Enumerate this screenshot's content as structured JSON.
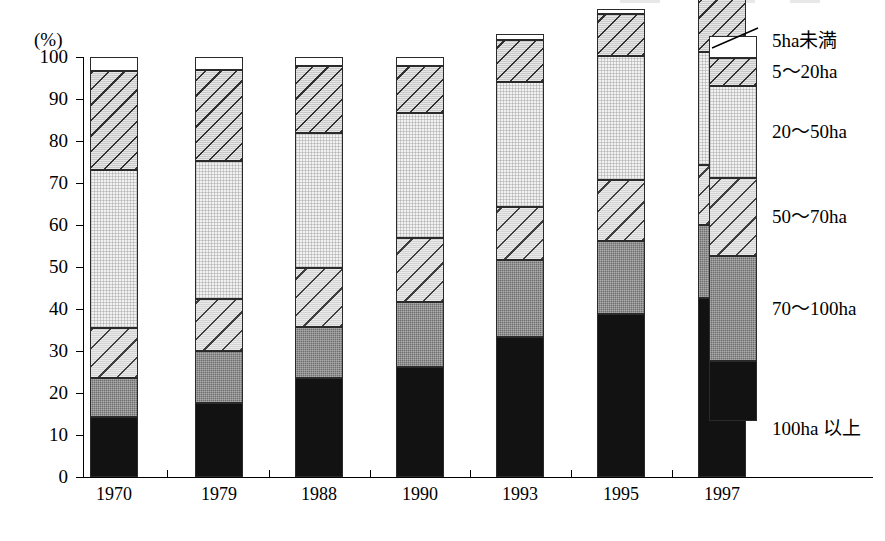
{
  "chart_data": {
    "type": "bar",
    "subtype": "stacked-percentage",
    "title": "",
    "xlabel": "",
    "ylabel": "(%)",
    "ylim": [
      0,
      100
    ],
    "ytick_labels": [
      "0",
      "10",
      "20",
      "30",
      "40",
      "50",
      "60",
      "70",
      "80",
      "90",
      "100"
    ],
    "ytick_values": [
      0,
      10,
      20,
      30,
      40,
      50,
      60,
      70,
      80,
      90,
      100
    ],
    "grid": false,
    "legend_position": "right",
    "categories": [
      "1970",
      "1979",
      "1988",
      "1990",
      "1993",
      "1995",
      "1997"
    ],
    "series": [
      {
        "name": "100ha 以上",
        "pattern": "solid-black",
        "color": "#121212",
        "values": [
          14.3,
          17.6,
          23.6,
          26.2,
          33.3,
          38.8,
          42.6
        ]
      },
      {
        "name": "70～100ha",
        "pattern": "mid-gray",
        "color": "#6e6e6e",
        "values": [
          9.3,
          12.4,
          12.1,
          15.5,
          18.3,
          17.4,
          17.4
        ]
      },
      {
        "name": "50～70ha",
        "pattern": "diagonal-hatch",
        "color": "#d4d4d4",
        "values": [
          11.9,
          12.4,
          14.0,
          15.2,
          12.6,
          14.5,
          14.3
        ]
      },
      {
        "name": "20～50ha",
        "pattern": "light-dots",
        "color": "#f2f2f2",
        "values": [
          37.6,
          32.9,
          32.1,
          29.8,
          29.8,
          29.5,
          26.9
        ]
      },
      {
        "name": "5～20ha",
        "pattern": "diagonal-hatch",
        "color": "#c9c9c9",
        "values": [
          23.6,
          21.7,
          16.0,
          11.2,
          10.0,
          10.0,
          12.9
        ]
      },
      {
        "name": "5ha未満",
        "pattern": "white",
        "color": "#ffffff",
        "values": [
          3.3,
          3.0,
          2.2,
          2.1,
          1.5,
          1.2,
          1.7
        ]
      }
    ]
  },
  "axis": {
    "unit_label": "(%)"
  },
  "legend": {
    "items": [
      {
        "label": "5ha未満"
      },
      {
        "label": "5～20ha"
      },
      {
        "label": "20～50ha"
      },
      {
        "label": "50～70ha"
      },
      {
        "label": "70～100ha"
      },
      {
        "label": "100ha 以上"
      }
    ]
  }
}
